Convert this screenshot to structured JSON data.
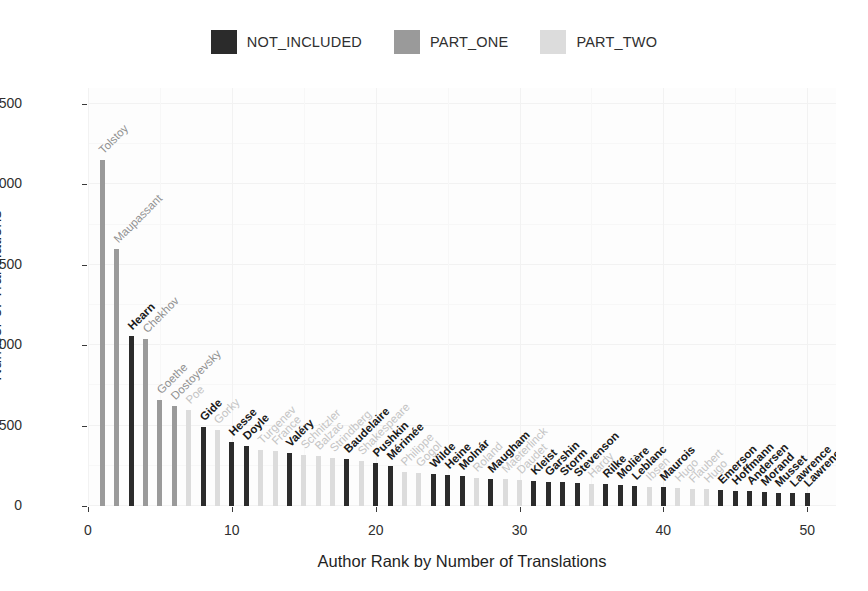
{
  "chart_data": {
    "type": "bar",
    "title": "",
    "xlabel": "Author Rank by Number of Translations",
    "ylabel": "Number of Translations",
    "xlim": [
      0,
      52
    ],
    "ylim": [
      0,
      2600
    ],
    "yticks": [
      0,
      500,
      1000,
      1500,
      2000,
      2500
    ],
    "xticks": [
      0,
      10,
      20,
      30,
      40,
      50
    ],
    "grid": true,
    "legend_position": "top",
    "legend": [
      {
        "label": "NOT_INCLUDED",
        "color": "#2b2b2b"
      },
      {
        "label": "PART_ONE",
        "color": "#9a9a9a"
      },
      {
        "label": "PART_TWO",
        "color": "#dcdcdc"
      }
    ],
    "categories": [
      "Tolstoy",
      "Maupassant",
      "Hearn",
      "Chekhov",
      "Goethe",
      "Dostoyevsky",
      "Poe",
      "Gide",
      "Gorky",
      "Hesse",
      "Doyle",
      "Turgenev",
      "France",
      "Valéry",
      "Schnitzler",
      "Balzac",
      "Strindberg",
      "Baudelaire",
      "Shakespeare",
      "Pushkin",
      "Mérimée",
      "Philippe",
      "Gogol",
      "Wilde",
      "Heine",
      "Molnár",
      "Roland",
      "Maugham",
      "Maeterlinck",
      "Daudet",
      "Kleist",
      "Garshin",
      "Storm",
      "Stevenson",
      "Hardy",
      "Rilke",
      "Molière",
      "Leblanc",
      "Ibsen",
      "Maurois",
      "Hugo",
      "Flaubert",
      "Hugo",
      "Emerson",
      "Hoffmann",
      "Andersen",
      "Morand",
      "Musset",
      "Lawrence",
      "Lawrence"
    ],
    "ranks": [
      1,
      2,
      3,
      4,
      5,
      6,
      7,
      8,
      9,
      10,
      11,
      12,
      13,
      14,
      15,
      16,
      17,
      18,
      19,
      20,
      21,
      22,
      23,
      24,
      25,
      26,
      27,
      28,
      29,
      30,
      31,
      32,
      33,
      34,
      35,
      36,
      37,
      38,
      39,
      40,
      41,
      42,
      43,
      44,
      45,
      46,
      47,
      48,
      49,
      50
    ],
    "values": [
      2150,
      1600,
      1060,
      1040,
      660,
      620,
      600,
      490,
      470,
      400,
      375,
      350,
      340,
      330,
      320,
      310,
      300,
      290,
      280,
      265,
      250,
      210,
      205,
      200,
      190,
      185,
      175,
      170,
      165,
      160,
      155,
      150,
      148,
      145,
      140,
      135,
      130,
      125,
      120,
      118,
      112,
      108,
      105,
      100,
      96,
      92,
      88,
      84,
      80,
      78
    ],
    "groups": [
      "PART_ONE",
      "PART_ONE",
      "NOT_INCLUDED",
      "PART_ONE",
      "PART_ONE",
      "PART_ONE",
      "PART_TWO",
      "NOT_INCLUDED",
      "PART_TWO",
      "NOT_INCLUDED",
      "NOT_INCLUDED",
      "PART_TWO",
      "PART_TWO",
      "NOT_INCLUDED",
      "PART_TWO",
      "PART_TWO",
      "PART_TWO",
      "NOT_INCLUDED",
      "PART_TWO",
      "NOT_INCLUDED",
      "NOT_INCLUDED",
      "PART_TWO",
      "PART_TWO",
      "NOT_INCLUDED",
      "NOT_INCLUDED",
      "NOT_INCLUDED",
      "PART_TWO",
      "NOT_INCLUDED",
      "PART_TWO",
      "PART_TWO",
      "NOT_INCLUDED",
      "NOT_INCLUDED",
      "NOT_INCLUDED",
      "NOT_INCLUDED",
      "PART_TWO",
      "NOT_INCLUDED",
      "NOT_INCLUDED",
      "NOT_INCLUDED",
      "PART_TWO",
      "NOT_INCLUDED",
      "PART_TWO",
      "PART_TWO",
      "PART_TWO",
      "NOT_INCLUDED",
      "NOT_INCLUDED",
      "NOT_INCLUDED",
      "NOT_INCLUDED",
      "NOT_INCLUDED",
      "NOT_INCLUDED",
      "NOT_INCLUDED"
    ]
  }
}
